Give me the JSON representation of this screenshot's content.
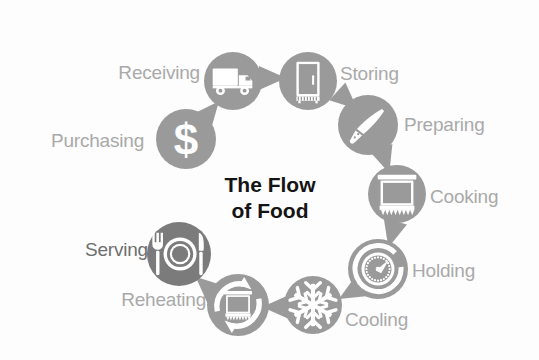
{
  "diagram": {
    "title": "The Flow of Food",
    "title_lines": "The Flow\nof Food",
    "type": "cycle",
    "background_color": "#fdfdfd",
    "circle_fill": "#9a9a9a",
    "circle_fill_dark": "#7b7b7b",
    "arrow_fill": "#9a9a9a",
    "label_color": "#a9a9a9",
    "label_color_dark": "#6f6f6f",
    "icon_color": "#ffffff",
    "center": {
      "x": 270,
      "y": 196
    },
    "radius": 128,
    "steps": [
      {
        "id": "purchasing",
        "label": "Purchasing",
        "icon": "dollar-sign-icon",
        "order": 1,
        "cx": 186,
        "cy": 139,
        "r": 30,
        "label_x": 144,
        "label_y": 140,
        "label_side": "left",
        "label_tone": "light",
        "circle_tone": "light"
      },
      {
        "id": "receiving",
        "label": "Receiving",
        "icon": "delivery-truck-icon",
        "order": 2,
        "cx": 233,
        "cy": 81,
        "r": 29,
        "label_x": 200,
        "label_y": 72,
        "label_side": "left",
        "label_tone": "light",
        "circle_tone": "light"
      },
      {
        "id": "storing",
        "label": "Storing",
        "icon": "refrigerator-icon",
        "order": 3,
        "cx": 308,
        "cy": 81,
        "r": 29,
        "label_x": 340,
        "label_y": 73,
        "label_side": "right",
        "label_tone": "light",
        "circle_tone": "light"
      },
      {
        "id": "preparing",
        "label": "Preparing",
        "icon": "chef-knife-icon",
        "order": 4,
        "cx": 368,
        "cy": 125,
        "r": 30,
        "label_x": 404,
        "label_y": 124,
        "label_side": "right",
        "label_tone": "light",
        "circle_tone": "light"
      },
      {
        "id": "cooking",
        "label": "Cooking",
        "icon": "oven-icon",
        "order": 5,
        "cx": 397,
        "cy": 194,
        "r": 29,
        "label_x": 430,
        "label_y": 196,
        "label_side": "right",
        "label_tone": "light",
        "circle_tone": "light"
      },
      {
        "id": "holding",
        "label": "Holding",
        "icon": "thermometer-dial-icon",
        "order": 6,
        "cx": 378,
        "cy": 269,
        "r": 30,
        "label_x": 412,
        "label_y": 270,
        "label_side": "right",
        "label_tone": "light",
        "circle_tone": "light"
      },
      {
        "id": "cooling",
        "label": "Cooling",
        "icon": "snowflake-icon",
        "order": 7,
        "cx": 313,
        "cy": 305,
        "r": 29,
        "label_x": 345,
        "label_y": 319,
        "label_side": "right",
        "label_tone": "light",
        "circle_tone": "light"
      },
      {
        "id": "reheating",
        "label": "Reheating",
        "icon": "reheat-oven-icon",
        "order": 8,
        "cx": 238,
        "cy": 305,
        "r": 31,
        "label_x": 206,
        "label_y": 299,
        "label_side": "left",
        "label_tone": "light",
        "circle_tone": "light"
      },
      {
        "id": "serving",
        "label": "Serving",
        "icon": "plate-cutlery-icon",
        "order": 9,
        "cx": 179,
        "cy": 254,
        "r": 32,
        "label_x": 148,
        "label_y": 249,
        "label_side": "left",
        "label_tone": "dark",
        "circle_tone": "dark"
      }
    ],
    "arrows": [
      {
        "from": "purchasing",
        "to": "receiving",
        "x": 210,
        "y": 112,
        "rot": -50
      },
      {
        "from": "receiving",
        "to": "storing",
        "x": 272,
        "y": 78,
        "rot": 0
      },
      {
        "from": "storing",
        "to": "preparing",
        "x": 347,
        "y": 100,
        "rot": 42
      },
      {
        "from": "preparing",
        "to": "cooking",
        "x": 385,
        "y": 160,
        "rot": 72
      },
      {
        "from": "cooking",
        "to": "holding",
        "x": 392,
        "y": 234,
        "rot": 105
      },
      {
        "from": "holding",
        "to": "cooling",
        "x": 351,
        "y": 292,
        "rot": 150
      },
      {
        "from": "cooling",
        "to": "reheating",
        "x": 276,
        "y": 307,
        "rot": 180
      },
      {
        "from": "reheating",
        "to": "serving",
        "x": 206,
        "y": 286,
        "rot": -138
      }
    ]
  }
}
